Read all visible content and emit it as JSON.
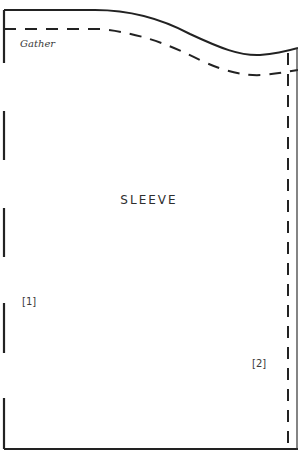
{
  "pattern": {
    "piece_name": "SLEEVE",
    "gather_label": "Gather",
    "marker_1": "[1]",
    "marker_2": "[2]",
    "line_color": "#222222",
    "text_color": "#333333"
  }
}
